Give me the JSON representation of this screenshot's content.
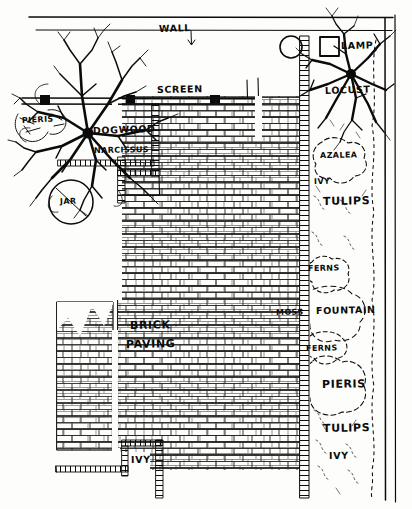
{
  "plan": {
    "title": "Garden Landscape Plan",
    "style": "hand-drawn architectural site plan",
    "ink_color": "#0b0b0b",
    "paper_color": "#fdfdfb",
    "width": 412,
    "height": 509
  },
  "labels": {
    "wall": "WALL",
    "screen": "SCREEN",
    "lamp": "LAMP",
    "locust": "LOCUST",
    "pieris_top": "PIERIS",
    "dogwood": "DOGWOOD",
    "narcissus": "NARCISSUS",
    "jar": "JAR",
    "azalea": "AZALEA",
    "ivy_upper_right": "IVY",
    "tulips_upper_right": "TULIPS",
    "ferns_upper": "FERNS",
    "moss": "MOSS",
    "fountain": "FOUNTAIN",
    "ferns_lower": "FERNS",
    "pieris_lower": "PIERIS",
    "tulips_lower_right": "TULIPS",
    "ivy_lower_right": "IVY",
    "brick_line1": "BRICK",
    "brick_line2": "PAVING",
    "ivy_bottom_left": "IVY"
  },
  "features": [
    {
      "name": "wall",
      "type": "boundary-line",
      "label": "WALL"
    },
    {
      "name": "screen",
      "type": "boundary-line",
      "label": "SCREEN"
    },
    {
      "name": "lamp",
      "type": "fixture-symbol",
      "label": "LAMP"
    },
    {
      "name": "fountain",
      "type": "water-feature",
      "label": "FOUNTAIN"
    },
    {
      "name": "jar",
      "type": "container-symbol",
      "label": "JAR"
    },
    {
      "name": "brick-paving",
      "type": "paving-surface",
      "label": "BRICK PAVING"
    },
    {
      "name": "dogwood-tree",
      "type": "tree",
      "label": "DOGWOOD"
    },
    {
      "name": "locust-tree",
      "type": "tree",
      "label": "LOCUST"
    }
  ],
  "plants": [
    "PIERIS",
    "DOGWOOD",
    "NARCISSUS",
    "LOCUST",
    "AZALEA",
    "IVY",
    "TULIPS",
    "FERNS",
    "MOSS",
    "PIERIS",
    "TULIPS",
    "IVY"
  ]
}
